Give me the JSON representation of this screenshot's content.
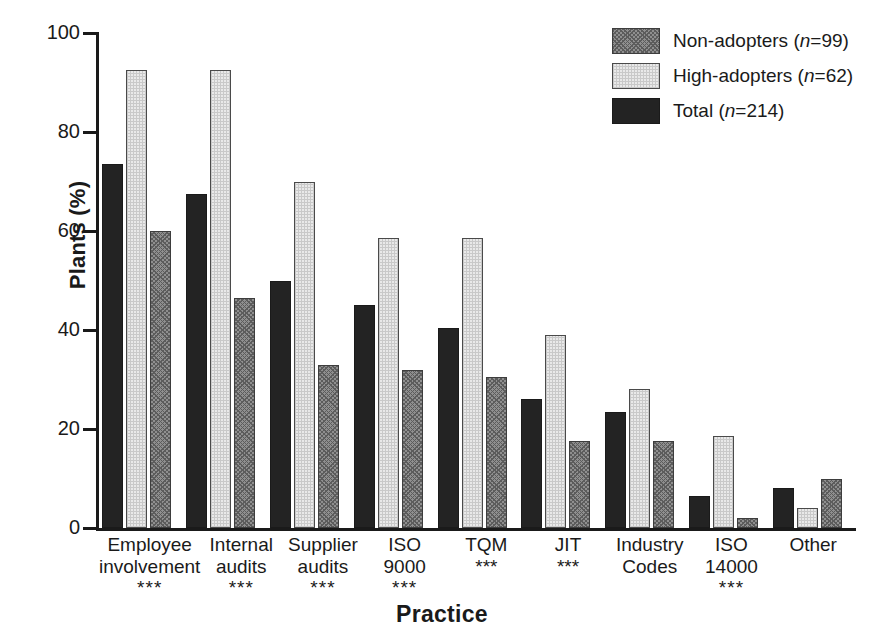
{
  "chart_data": {
    "type": "bar",
    "title": "",
    "xlabel": "Practice",
    "ylabel": "Plants (%)",
    "ylim": [
      0,
      100
    ],
    "yticks": [
      0,
      20,
      40,
      60,
      80,
      100
    ],
    "grid": false,
    "legend_position": "top-right",
    "categories": [
      "Employee involvement",
      "Internal audits",
      "Supplier audits",
      "ISO 9000",
      "TQM",
      "JIT",
      "Industry Codes",
      "ISO 14000",
      "Other"
    ],
    "series": [
      {
        "name": "Total (n=214)",
        "key": "total",
        "fill": "solid-dark",
        "color": "#232323",
        "values": [
          73.5,
          67.5,
          50.0,
          45.0,
          40.5,
          26.0,
          23.5,
          6.5,
          8.0
        ]
      },
      {
        "name": "High-adopters (n=62)",
        "key": "high",
        "fill": "light-dotted",
        "color": "#e9e9e9",
        "values": [
          92.5,
          92.5,
          70.0,
          58.5,
          58.5,
          39.0,
          28.0,
          18.5,
          4.0
        ]
      },
      {
        "name": "Non-adopters (n=99)",
        "key": "non",
        "fill": "medium-hatch",
        "color": "#8f8f8f",
        "values": [
          60.0,
          46.5,
          33.0,
          32.0,
          30.5,
          17.5,
          17.5,
          2.0,
          10.0
        ]
      }
    ],
    "significance": [
      "***",
      "***",
      "***",
      "***",
      "***",
      "***",
      "",
      "***",
      ""
    ],
    "annotations": [
      "*** denotes significance marker beneath category label"
    ]
  },
  "axis": {
    "y_title": "Plants (%)",
    "x_title": "Practice",
    "ticks": [
      {
        "label": "100",
        "value": 100
      },
      {
        "label": "80",
        "value": 80
      },
      {
        "label": "60",
        "value": 60
      },
      {
        "label": "40",
        "value": 40
      },
      {
        "label": "20",
        "value": 20
      },
      {
        "label": "0",
        "value": 0
      }
    ]
  },
  "legend": {
    "items": [
      {
        "label_main": "Non-adopters (",
        "label_n": "n",
        "label_tail": "=99)",
        "swatch": "medium-hatch"
      },
      {
        "label_main": "High-adopters (",
        "label_n": "n",
        "label_tail": "=62)",
        "swatch": "light-dotted"
      },
      {
        "label_main": "Total (",
        "label_n": "n",
        "label_tail": "=214)",
        "swatch": "solid-dark"
      }
    ]
  },
  "categories_display": [
    {
      "line1": "Employee",
      "line2": "involvement",
      "sig": "***"
    },
    {
      "line1": "Internal",
      "line2": "audits",
      "sig": "***"
    },
    {
      "line1": "Supplier",
      "line2": "audits",
      "sig": "***"
    },
    {
      "line1": "ISO",
      "line2": "9000",
      "sig": "***"
    },
    {
      "line1": "TQM",
      "line2": "***",
      "sig": ""
    },
    {
      "line1": "JIT",
      "line2": "***",
      "sig": ""
    },
    {
      "line1": "Industry",
      "line2": "Codes",
      "sig": ""
    },
    {
      "line1": "ISO",
      "line2": "14000",
      "sig": "***"
    },
    {
      "line1": "Other",
      "line2": "",
      "sig": ""
    }
  ],
  "colors": {
    "axis": "#1a1a1a",
    "text": "#1a1a1a",
    "background": "#ffffff",
    "series_total": "#232323",
    "series_high": "#e9e9e9",
    "series_non": "#8f8f8f"
  }
}
